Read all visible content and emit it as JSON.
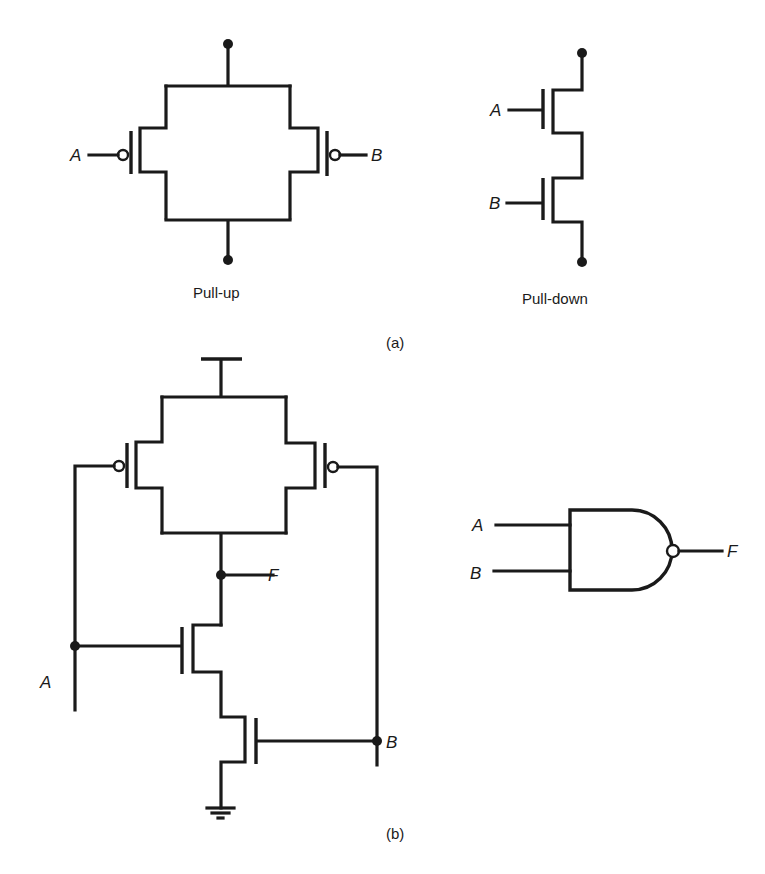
{
  "figure": {
    "part_a": {
      "label": "(a)",
      "pull_up": {
        "caption": "Pull-up",
        "inputs": {
          "left": "A",
          "right": "B"
        }
      },
      "pull_down": {
        "caption": "Pull-down",
        "inputs": {
          "top": "A",
          "bottom": "B"
        }
      }
    },
    "part_b": {
      "label": "(b)",
      "cmos_nand": {
        "input_a": "A",
        "input_b": "B",
        "output": "F"
      },
      "logic_symbol": {
        "type": "NAND",
        "input_a": "A",
        "input_b": "B",
        "output": "F"
      }
    }
  },
  "colors": {
    "ink": "#1a1a1a",
    "background": "#ffffff"
  }
}
